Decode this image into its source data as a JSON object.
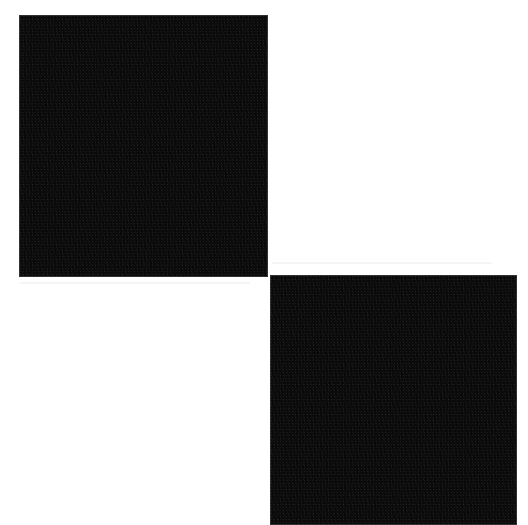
{
  "canvas": {
    "width": 528,
    "height": 520,
    "background": "#ffffff"
  },
  "shapes": [
    {
      "id": "square-top-left",
      "color": "#0a0a0a",
      "x": 19,
      "y": 15,
      "width": 249,
      "height": 262
    },
    {
      "id": "square-bottom-right",
      "color": "#0a0a0a",
      "x": 270,
      "y": 275,
      "width": 247,
      "height": 250
    }
  ]
}
